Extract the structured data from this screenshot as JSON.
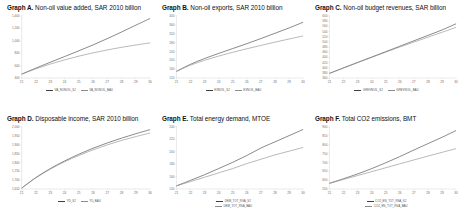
{
  "figure": {
    "name": "six-panel-scenario-projection-figure",
    "panels_across": 3,
    "panels_down": 2
  },
  "chart_data": [
    {
      "type": "line",
      "panel_label": "Graph A.",
      "title_text": "Non-oil value added, SAR 2010 billion",
      "title": "Graph A. Non-oil value added, SAR 2010 billion",
      "xlabel": "",
      "ylabel": "",
      "grid": false,
      "legend_position": "bottom",
      "categories": [
        "21",
        "22",
        "23",
        "24",
        "25",
        "26",
        "27",
        "28",
        "29",
        "30"
      ],
      "x": [
        21,
        22,
        23,
        24,
        25,
        26,
        27,
        28,
        29,
        30
      ],
      "xlim": [
        21,
        30
      ],
      "ylim": [
        400,
        1400
      ],
      "yticks": [
        "1,400",
        "1,200",
        "1,000",
        "800",
        "600",
        "400"
      ],
      "ytick_values": [
        1400,
        1200,
        1000,
        800,
        600,
        400
      ],
      "series": [
        {
          "name": "VA_NONOIL_S2",
          "color": "#3f3f3f",
          "values": [
            462,
            560,
            654,
            745,
            838,
            933,
            1035,
            1142,
            1252,
            1360
          ]
        },
        {
          "name": "VA_NONOIL_BAU",
          "color": "#8c8c8c",
          "values": [
            462,
            548,
            625,
            692,
            752,
            805,
            852,
            895,
            932,
            966
          ]
        }
      ]
    },
    {
      "type": "line",
      "panel_label": "Graph B.",
      "title_text": "Non-oil exports, SAR 2010 billion",
      "title": "Graph B. Non-oil exports, SAR 2010 billion",
      "xlabel": "",
      "ylabel": "",
      "grid": false,
      "legend_position": "bottom",
      "categories": [
        "21",
        "22",
        "23",
        "24",
        "25",
        "26",
        "27",
        "28",
        "29",
        "30"
      ],
      "x": [
        21,
        22,
        23,
        24,
        25,
        26,
        27,
        28,
        29,
        30
      ],
      "xlim": [
        21,
        30
      ],
      "ylim": [
        120,
        400
      ],
      "yticks": [
        "400",
        "360",
        "320",
        "280",
        "240",
        "200",
        "160",
        "120"
      ],
      "ytick_values": [
        400,
        360,
        320,
        280,
        240,
        200,
        160,
        120
      ],
      "series": [
        {
          "name": "EXNOIL_S2",
          "color": "#3f3f3f",
          "values": [
            150,
            182,
            208,
            231,
            253,
            275,
            298,
            322,
            346,
            372
          ]
        },
        {
          "name": "EXNOIL_BAU",
          "color": "#8c8c8c",
          "values": [
            150,
            178,
            200,
            219,
            236,
            252,
            267,
            282,
            296,
            310
          ]
        }
      ]
    },
    {
      "type": "line",
      "panel_label": "Graph C.",
      "title_text": "Non-oil budget revenues, SAR billion",
      "title": "Graph C. Non-oil budget revenues, SAR billion",
      "xlabel": "",
      "ylabel": "",
      "grid": false,
      "legend_position": "bottom",
      "categories": [
        "21",
        "22",
        "23",
        "24",
        "25",
        "26",
        "27",
        "28",
        "29",
        "30"
      ],
      "x": [
        21,
        22,
        23,
        24,
        25,
        26,
        27,
        28,
        29,
        30
      ],
      "xlim": [
        21,
        30
      ],
      "ylim": [
        360,
        600
      ],
      "yticks": [
        "600",
        "580",
        "560",
        "540",
        "520",
        "500",
        "480",
        "460",
        "440",
        "420",
        "400",
        "380",
        "360"
      ],
      "ytick_values": [
        600,
        580,
        560,
        540,
        520,
        500,
        480,
        460,
        440,
        420,
        400,
        380,
        360
      ],
      "series": [
        {
          "name": "GREVNOIL_S2",
          "color": "#3f3f3f",
          "values": [
            378,
            399,
            420,
            441,
            462,
            483,
            504,
            525,
            546,
            570
          ]
        },
        {
          "name": "GREVNOIL_BAU",
          "color": "#8c8c8c",
          "values": [
            378,
            399,
            420,
            440,
            460,
            480,
            499,
            518,
            537,
            556
          ]
        }
      ]
    },
    {
      "type": "line",
      "panel_label": "Graph D.",
      "title_text": "Disposable income, SAR 2010 billion",
      "title": "Graph D. Disposable income, SAR 2010 billion",
      "xlabel": "",
      "ylabel": "",
      "grid": false,
      "legend_position": "bottom",
      "categories": [
        "21",
        "22",
        "23",
        "24",
        "25",
        "26",
        "27",
        "28",
        "29",
        "30"
      ],
      "x": [
        21,
        22,
        23,
        24,
        25,
        26,
        27,
        28,
        29,
        30
      ],
      "xlim": [
        21,
        30
      ],
      "ylim": [
        1650,
        2000
      ],
      "yticks": [
        "2,000",
        "1,950",
        "1,900",
        "1,850",
        "1,800",
        "1,750",
        "1,700",
        "1,650"
      ],
      "ytick_values": [
        2000,
        1950,
        1900,
        1850,
        1800,
        1750,
        1700,
        1650
      ],
      "series": [
        {
          "name": "YD_S2",
          "color": "#3f3f3f",
          "values": [
            1655,
            1715,
            1765,
            1808,
            1846,
            1880,
            1910,
            1937,
            1962,
            1985
          ]
        },
        {
          "name": "YD_BAU",
          "color": "#8c8c8c",
          "values": [
            1655,
            1713,
            1762,
            1803,
            1839,
            1871,
            1899,
            1924,
            1946,
            1966
          ]
        }
      ]
    },
    {
      "type": "line",
      "panel_label": "Graph E.",
      "title_text": "Total energy demand, MTOE",
      "title": "Graph E. Total energy demand, MTOE",
      "xlabel": "",
      "ylabel": "",
      "grid": false,
      "legend_position": "bottom",
      "categories": [
        "21",
        "22",
        "23",
        "24",
        "25",
        "26",
        "27",
        "28",
        "29",
        "30"
      ],
      "x": [
        21,
        22,
        23,
        24,
        25,
        26,
        27,
        28,
        29,
        30
      ],
      "xlim": [
        21,
        30
      ],
      "ylim": [
        140,
        240
      ],
      "yticks": [
        "240",
        "220",
        "200",
        "180",
        "160",
        "140"
      ],
      "ytick_values": [
        240,
        220,
        200,
        180,
        160,
        140
      ],
      "series": [
        {
          "name": "DEM_TOT_RSA_S2",
          "color": "#3f3f3f",
          "values": [
            145,
            154,
            163,
            173,
            183,
            194,
            206,
            216,
            226,
            236
          ]
        },
        {
          "name": "DEM_TOT_RSA_BAU",
          "color": "#8c8c8c",
          "values": [
            145,
            152,
            159,
            166,
            173,
            181,
            188,
            195,
            201,
            207
          ]
        }
      ]
    },
    {
      "type": "line",
      "panel_label": "Graph F.",
      "title_text": "Total CO2 emissions, BMT",
      "title": "Graph F. Total CO2 emissions, BMT",
      "xlabel": "",
      "ylabel": "",
      "grid": false,
      "legend_position": "bottom",
      "categories": [
        "21",
        "22",
        "23",
        "24",
        "25",
        "26",
        "27",
        "28",
        "29",
        "30"
      ],
      "x": [
        21,
        22,
        23,
        24,
        25,
        26,
        27,
        28,
        29,
        30
      ],
      "xlim": [
        21,
        30
      ],
      "ylim": [
        550,
        900
      ],
      "yticks": [
        "900",
        "850",
        "800",
        "750",
        "700",
        "650",
        "600",
        "550"
      ],
      "ytick_values": [
        900,
        850,
        800,
        750,
        700,
        650,
        600,
        550
      ],
      "series": [
        {
          "name": "CO2_EN_TOT_RSA_S2",
          "color": "#3f3f3f",
          "values": [
            582,
            608,
            635,
            665,
            698,
            733,
            770,
            806,
            842,
            880
          ]
        },
        {
          "name": "CO2_EN_TOT_RSA_BAU",
          "color": "#8c8c8c",
          "values": [
            582,
            604,
            626,
            648,
            670,
            692,
            714,
            736,
            757,
            778
          ]
        }
      ]
    }
  ]
}
